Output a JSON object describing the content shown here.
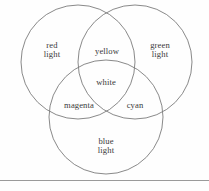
{
  "figure": {
    "kind": "venn-diagram",
    "background_color": "#fefefe",
    "stroke_color": "#7c7c7c",
    "rule_color": "#9a9a9a",
    "text_color": "#3a3a3a"
  },
  "circles": [
    {
      "id": "red-light",
      "label": "red\nlight",
      "cx": 78,
      "cy": 62,
      "r": 57
    },
    {
      "id": "green-light",
      "label": "green\nlight",
      "cx": 135,
      "cy": 62,
      "r": 57
    },
    {
      "id": "blue-light",
      "label": "blue\nlight",
      "cx": 106,
      "cy": 117,
      "r": 57
    }
  ],
  "labels": {
    "red_light": "red\nlight",
    "green_light": "green\nlight",
    "blue_light": "blue\nlight",
    "yellow": "yellow",
    "magenta": "magenta",
    "cyan": "cyan",
    "white": "white"
  },
  "label_positions": {
    "red_light": {
      "x": 52,
      "y": 50
    },
    "green_light": {
      "x": 160,
      "y": 50
    },
    "blue_light": {
      "x": 106,
      "y": 146
    },
    "yellow": {
      "x": 107,
      "y": 51
    },
    "white": {
      "x": 106,
      "y": 82
    },
    "magenta": {
      "x": 79,
      "y": 105
    },
    "cyan": {
      "x": 135,
      "y": 105
    }
  },
  "rule": {
    "x1": 0,
    "x2": 209,
    "y": 180
  }
}
